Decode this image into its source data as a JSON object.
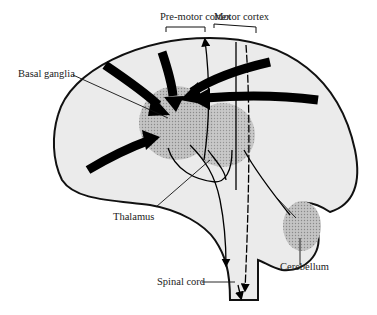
{
  "diagram": {
    "labels": {
      "premotor": "Pre-motor cortex",
      "motor": "Motor cortex",
      "basal_ganglia": "Basal ganglia",
      "thalamus": "Thalamus",
      "spinal_cord": "Spinal cord",
      "cerebellum": "Cerebellum"
    },
    "colors": {
      "brain_fill": "#ebebeb",
      "outline": "#111111",
      "nucleus_fill": "#b8b8b8",
      "arrow": "#000000"
    }
  }
}
